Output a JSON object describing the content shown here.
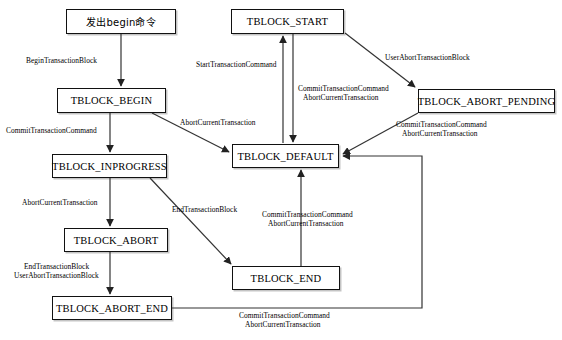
{
  "diagram": {
    "canvas": {
      "width": 562,
      "height": 340
    },
    "style": {
      "node_border": "#111111",
      "node_fill": "#ffffff",
      "edge_color": "#333333",
      "text_color": "#000000"
    },
    "nodes": [
      {
        "id": "issue_begin",
        "label": "发出begin命令",
        "x": 66,
        "y": 9,
        "w": 110,
        "h": 25,
        "cjk": true
      },
      {
        "id": "tblock_start",
        "label": "TBLOCK_START",
        "x": 231,
        "y": 9,
        "w": 113,
        "h": 25,
        "cjk": false
      },
      {
        "id": "tblock_begin",
        "label": "TBLOCK_BEGIN",
        "x": 57,
        "y": 88,
        "w": 109,
        "h": 25,
        "cjk": false
      },
      {
        "id": "abort_pending",
        "label": "TBLOCK_ABORT_PENDING",
        "x": 418,
        "y": 89,
        "w": 137,
        "h": 24,
        "cjk": false
      },
      {
        "id": "tblock_default",
        "label": "TBLOCK_DEFAULT",
        "x": 232,
        "y": 144,
        "w": 107,
        "h": 24,
        "cjk": false
      },
      {
        "id": "inprogress",
        "label": "TBLOCK_INPROGRESS",
        "x": 52,
        "y": 154,
        "w": 115,
        "h": 24,
        "cjk": false
      },
      {
        "id": "tblock_abort",
        "label": "TBLOCK_ABORT",
        "x": 64,
        "y": 228,
        "w": 104,
        "h": 24,
        "cjk": false
      },
      {
        "id": "tblock_end",
        "label": "TBLOCK_END",
        "x": 232,
        "y": 266,
        "w": 108,
        "h": 24,
        "cjk": false
      },
      {
        "id": "abort_end",
        "label": "TBLOCK_ABORT_END",
        "x": 52,
        "y": 296,
        "w": 120,
        "h": 24,
        "cjk": false
      }
    ],
    "edge_labels": [
      {
        "id": "lbl_begin_transaction_block",
        "text": "BeginTransactionBlock",
        "x": 26,
        "y": 56
      },
      {
        "id": "lbl_start_transaction_command",
        "text": "StartTransactionCommand",
        "x": 196,
        "y": 60
      },
      {
        "id": "lbl_user_abort_transaction_block",
        "text": "UserAbortTransactionBlock",
        "x": 385,
        "y": 53
      },
      {
        "id": "lbl_commit_abort_start_default_1",
        "text": "CommitTransactionCommand",
        "x": 298,
        "y": 84
      },
      {
        "id": "lbl_commit_abort_start_default_2",
        "text": "AbortCurrentTransaction",
        "x": 303,
        "y": 93
      },
      {
        "id": "lbl_commit_transaction_command",
        "text": "CommitTransactionCommand",
        "x": 6,
        "y": 126
      },
      {
        "id": "lbl_abort_current_transaction_diag",
        "text": "AbortCurrentTransaction",
        "x": 180,
        "y": 118
      },
      {
        "id": "lbl_pending_to_default_1",
        "text": "CommitTransactionCommand",
        "x": 396,
        "y": 120
      },
      {
        "id": "lbl_pending_to_default_2",
        "text": "AbortCurrentTransaction",
        "x": 402,
        "y": 129
      },
      {
        "id": "lbl_abort_current_transaction",
        "text": "AbortCurrentTransaction",
        "x": 22,
        "y": 198
      },
      {
        "id": "lbl_end_transaction_block_diag",
        "text": "EndTransactionBlock",
        "x": 172,
        "y": 205
      },
      {
        "id": "lbl_end_to_default_1",
        "text": "CommitTransactionCommand",
        "x": 262,
        "y": 210
      },
      {
        "id": "lbl_end_to_default_2",
        "text": "AbortCurrentTransaction",
        "x": 268,
        "y": 219
      },
      {
        "id": "lbl_abort_to_abortend_1",
        "text": "EndTransactionBlock",
        "x": 24,
        "y": 262
      },
      {
        "id": "lbl_abort_to_abortend_2",
        "text": "UserAbortTransactionBlock",
        "x": 14,
        "y": 271
      },
      {
        "id": "lbl_abortend_to_default_1",
        "text": "CommitTransactionCommand",
        "x": 239,
        "y": 311
      },
      {
        "id": "lbl_abortend_to_default_2",
        "text": "AbortCurrentTransaction",
        "x": 245,
        "y": 320
      }
    ],
    "edges": [
      {
        "id": "edge-issue-begin-to-tblock-begin",
        "from": "issue_begin",
        "to": "tblock_begin"
      },
      {
        "id": "edge-tblock-begin-to-inprogress",
        "from": "tblock_begin",
        "to": "inprogress"
      },
      {
        "id": "edge-tblock-begin-to-default",
        "from": "tblock_begin",
        "to": "tblock_default"
      },
      {
        "id": "edge-default-to-start",
        "from": "tblock_default",
        "to": "tblock_start"
      },
      {
        "id": "edge-start-to-default",
        "from": "tblock_start",
        "to": "tblock_default"
      },
      {
        "id": "edge-start-to-abort-pending",
        "from": "tblock_start",
        "to": "abort_pending"
      },
      {
        "id": "edge-abort-pending-to-default",
        "from": "abort_pending",
        "to": "tblock_default"
      },
      {
        "id": "edge-inprogress-to-abort",
        "from": "inprogress",
        "to": "tblock_abort"
      },
      {
        "id": "edge-inprogress-to-end",
        "from": "inprogress",
        "to": "tblock_end"
      },
      {
        "id": "edge-abort-to-abort-end",
        "from": "tblock_abort",
        "to": "abort_end"
      },
      {
        "id": "edge-end-to-default",
        "from": "tblock_end",
        "to": "tblock_default"
      },
      {
        "id": "edge-abort-end-to-default",
        "from": "abort_end",
        "to": "tblock_default"
      }
    ]
  }
}
